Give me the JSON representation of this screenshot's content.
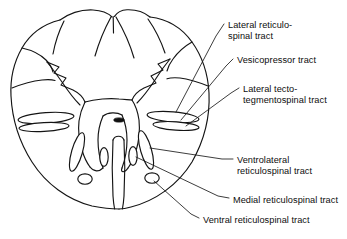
{
  "figure": {
    "background_color": "#ffffff",
    "line_color": "#141414",
    "text_color": "#0d0d0d"
  },
  "labels": [
    {
      "id": "lateral-reticulospinal",
      "text": "Lateral reticulo-\nspinal tract",
      "x": 228,
      "y": 20
    },
    {
      "id": "vesicopressor",
      "text": "Vesicopressor tract",
      "x": 237,
      "y": 55
    },
    {
      "id": "lateral-tecto-tegmentospinal",
      "text": "Lateral tecto-\ntegmentospinal tract",
      "x": 243,
      "y": 84
    },
    {
      "id": "ventrolateral-reticulospinal",
      "text": "Ventrolateral\nreticulospinal tract",
      "x": 237,
      "y": 155
    },
    {
      "id": "medial-reticulospinal",
      "text": "Medial reticulospinal tract",
      "x": 233,
      "y": 195
    },
    {
      "id": "ventral-reticulospinal",
      "text": "Ventral reticulospinal tract",
      "x": 203,
      "y": 215
    }
  ],
  "structures": {
    "cord_outline": "spinal-cord-outline",
    "gray_matter": "butterfly-gray-matter",
    "central_canal": "central-canal",
    "ventral_median_fissure": "ventral-median-fissure",
    "dorsal_median_sulcus": "dorsal-median-sulcus",
    "tract_count": 8
  }
}
